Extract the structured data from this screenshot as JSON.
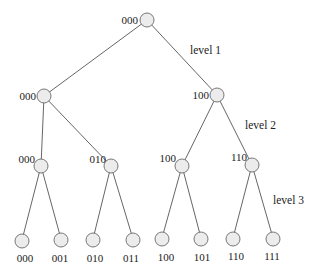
{
  "diagram": {
    "type": "binary-tree",
    "colors": {
      "node_fill": "#ececec",
      "node_stroke": "#6a6a6a",
      "edge": "#555555",
      "text": "#222222"
    },
    "level_labels": [
      {
        "id": "level-1",
        "text": "level 1"
      },
      {
        "id": "level-2",
        "text": "level 2"
      },
      {
        "id": "level-3",
        "text": "level 3"
      }
    ],
    "nodes": {
      "root": {
        "label": "000"
      },
      "l1": [
        {
          "label": "000"
        },
        {
          "label": "100"
        }
      ],
      "l2": [
        {
          "label": "000"
        },
        {
          "label": "010"
        },
        {
          "label": "100"
        },
        {
          "label": "110"
        }
      ],
      "leaves": [
        {
          "label": "000"
        },
        {
          "label": "001"
        },
        {
          "label": "010"
        },
        {
          "label": "011"
        },
        {
          "label": "100"
        },
        {
          "label": "101"
        },
        {
          "label": "110"
        },
        {
          "label": "111"
        }
      ]
    }
  }
}
